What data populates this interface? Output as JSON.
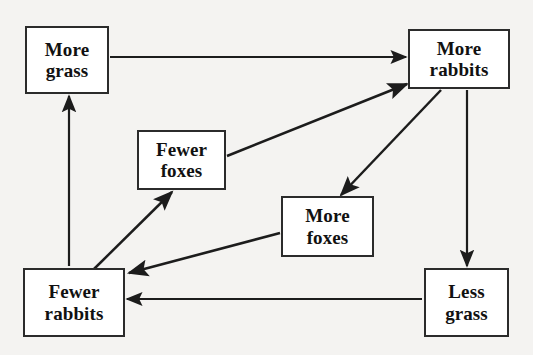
{
  "diagram": {
    "canvas": {
      "width": 533,
      "height": 355
    },
    "style": {
      "background_color": "#f4f3f1",
      "node_fill": "#ffffff",
      "node_border_color": "#2b2b2b",
      "edge_color": "#1c1c1c",
      "text_color": "#111111"
    },
    "nodes": [
      {
        "id": "more-grass",
        "label": "More grass",
        "line1": "More",
        "line2": "grass",
        "x": 25,
        "y": 26,
        "width": 84,
        "height": 68
      },
      {
        "id": "more-rabbits",
        "label": "More rabbits",
        "line1": "More",
        "line2": "rabbits",
        "x": 408,
        "y": 29,
        "width": 102,
        "height": 60
      },
      {
        "id": "fewer-foxes",
        "label": "Fewer foxes",
        "line1": "Fewer",
        "line2": "foxes",
        "x": 137,
        "y": 130,
        "width": 89,
        "height": 60
      },
      {
        "id": "more-foxes",
        "label": "More foxes",
        "line1": "More",
        "line2": "foxes",
        "x": 281,
        "y": 196,
        "width": 93,
        "height": 61
      },
      {
        "id": "fewer-rabbits",
        "label": "Fewer rabbits",
        "line1": "Fewer",
        "line2": "rabbits",
        "x": 23,
        "y": 268,
        "width": 102,
        "height": 69
      },
      {
        "id": "less-grass",
        "label": "Less grass",
        "line1": "Less",
        "line2": "grass",
        "x": 424,
        "y": 268,
        "width": 85,
        "height": 69
      }
    ],
    "edges": [
      {
        "id": "more-grass-to-more-rabbits",
        "from": "more-grass",
        "to": "more-rabbits",
        "label": "",
        "x1": 110,
        "y1": 57,
        "x2": 406,
        "y2": 57
      },
      {
        "id": "fewer-foxes-to-more-rabbits",
        "from": "fewer-foxes",
        "to": "more-rabbits",
        "label": "",
        "x1": 227,
        "y1": 156,
        "x2": 407,
        "y2": 84
      },
      {
        "id": "more-rabbits-to-more-foxes",
        "from": "more-rabbits",
        "to": "more-foxes",
        "label": "",
        "x1": 441,
        "y1": 90,
        "x2": 341,
        "y2": 195
      },
      {
        "id": "more-rabbits-to-less-grass",
        "from": "more-rabbits",
        "to": "less-grass",
        "label": "",
        "x1": 467,
        "y1": 90,
        "x2": 467,
        "y2": 266
      },
      {
        "id": "less-grass-to-fewer-rabbits",
        "from": "less-grass",
        "to": "fewer-rabbits",
        "label": "",
        "x1": 422,
        "y1": 299,
        "x2": 127,
        "y2": 299
      },
      {
        "id": "more-foxes-to-fewer-rabbits",
        "from": "more-foxes",
        "to": "fewer-rabbits",
        "label": "",
        "x1": 280,
        "y1": 233,
        "x2": 129,
        "y2": 273
      },
      {
        "id": "fewer-rabbits-to-fewer-foxes",
        "from": "fewer-rabbits",
        "to": "fewer-foxes",
        "label": "",
        "x1": 94,
        "y1": 269,
        "x2": 172,
        "y2": 192
      },
      {
        "id": "fewer-rabbits-to-more-grass",
        "from": "fewer-rabbits",
        "to": "more-grass",
        "label": "",
        "x1": 69,
        "y1": 266,
        "x2": 69,
        "y2": 96
      }
    ]
  }
}
